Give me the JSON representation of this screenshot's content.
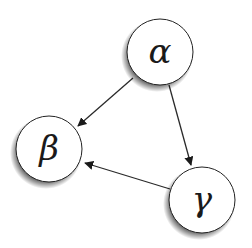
{
  "diagram": {
    "type": "directed-graph",
    "background": "#ffffff",
    "node_fill": "#ffffff",
    "node_stroke": "#222222",
    "edge_color": "#2a2a2a",
    "nodes": [
      {
        "id": "alpha",
        "label": "α",
        "cx": 160,
        "cy": 52,
        "r": 33
      },
      {
        "id": "beta",
        "label": "β",
        "cx": 49,
        "cy": 149,
        "r": 33
      },
      {
        "id": "gamma",
        "label": "γ",
        "cx": 202,
        "cy": 200,
        "r": 33
      }
    ],
    "edges": [
      {
        "from": "alpha",
        "to": "beta"
      },
      {
        "from": "alpha",
        "to": "gamma"
      },
      {
        "from": "gamma",
        "to": "beta"
      }
    ]
  }
}
